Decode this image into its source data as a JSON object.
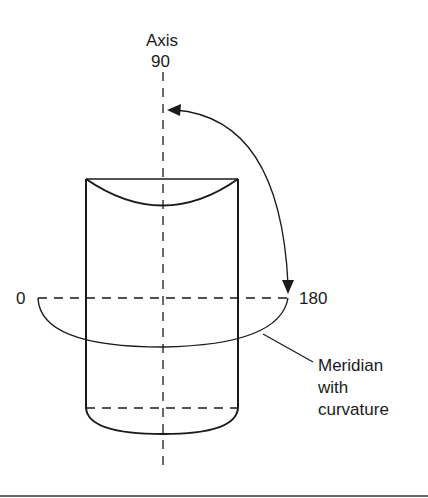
{
  "diagram": {
    "labels": {
      "axis_title": "Axis",
      "axis_value": "90",
      "left_meridian": "0",
      "right_meridian": "180",
      "callout_line1": "Meridian",
      "callout_line2": "with",
      "callout_line3": "curvature"
    },
    "colors": {
      "stroke": "#1a1a1a",
      "background": "#ffffff"
    }
  }
}
